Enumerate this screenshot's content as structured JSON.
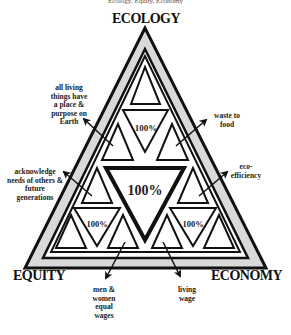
{
  "caption": "Ecology, Equity, Economy",
  "vertices": {
    "top": "ECOLOGY",
    "left": "EQUITY",
    "right": "ECONOMY"
  },
  "center_label": "100%",
  "sub_labels": {
    "top": "100%",
    "left": "100%",
    "right": "100%"
  },
  "annotations": [
    {
      "id": "all-living-things",
      "text": "all living things have a place & purpose on Earth"
    },
    {
      "id": "waste-to-food",
      "text": "waste to food"
    },
    {
      "id": "acknowledge-needs",
      "text": "acknowledge needs of others & future generations"
    },
    {
      "id": "eco-efficiency",
      "text": "eco-efficiency"
    },
    {
      "id": "equal-wages",
      "text": "men & women equal wages"
    },
    {
      "id": "living-wage",
      "text": "living wage"
    }
  ],
  "colors": {
    "band": "#d9d9d9",
    "stroke": "#111111",
    "fill": "#ffffff"
  }
}
